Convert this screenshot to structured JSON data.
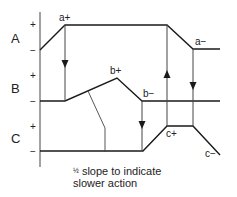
{
  "diagram": {
    "title": "",
    "signals": [
      {
        "name": "A",
        "plus": "+",
        "minus": "−"
      },
      {
        "name": "B",
        "plus": "+",
        "minus": "−"
      },
      {
        "name": "C",
        "plus": "+",
        "minus": "−"
      }
    ],
    "events": {
      "a_plus": "a+",
      "a_minus": "a−",
      "b_plus": "b+",
      "b_minus": "b−",
      "c_plus": "c+",
      "c_minus": "c−"
    },
    "annotation": {
      "fraction": "½",
      "line1": "slope to indicate",
      "line2": "slower action"
    },
    "colors": {
      "line": "#1a1a1a",
      "thin": "#444444"
    }
  }
}
